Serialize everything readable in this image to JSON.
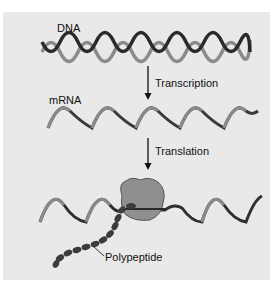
{
  "figure": {
    "labels": {
      "dna": "DNA",
      "transcription": "Transcription",
      "mrna": "mRNA",
      "translation": "Translation",
      "polypeptide": "Polypeptide"
    },
    "colors": {
      "background": "#e9e9e9",
      "strand_dark": "#2a2a2a",
      "strand_light": "#8a8a8a",
      "ribosome": "#8f8f8f",
      "text": "#111111"
    }
  }
}
